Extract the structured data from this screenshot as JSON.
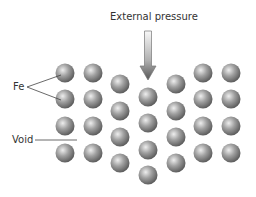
{
  "title": "External pressure",
  "labels": {
    "fe": "Fe",
    "void": "Void"
  },
  "colors": {
    "sphere_light": "#e8e8e8",
    "sphere_mid": "#9a9a9a",
    "sphere_dark": "#5a5a5a",
    "arrow_light": "#f2f2f2",
    "arrow_dark": "#666666",
    "line": "#444444"
  },
  "spheres": [
    {
      "x": 65,
      "y": 73
    },
    {
      "x": 65,
      "y": 99
    },
    {
      "x": 65,
      "y": 126
    },
    {
      "x": 65,
      "y": 153
    },
    {
      "x": 93,
      "y": 73
    },
    {
      "x": 93,
      "y": 99
    },
    {
      "x": 93,
      "y": 126
    },
    {
      "x": 93,
      "y": 153
    },
    {
      "x": 120,
      "y": 84
    },
    {
      "x": 120,
      "y": 111
    },
    {
      "x": 120,
      "y": 137
    },
    {
      "x": 120,
      "y": 163
    },
    {
      "x": 148,
      "y": 97
    },
    {
      "x": 148,
      "y": 123
    },
    {
      "x": 148,
      "y": 150
    },
    {
      "x": 148,
      "y": 175
    },
    {
      "x": 176,
      "y": 84
    },
    {
      "x": 176,
      "y": 111
    },
    {
      "x": 176,
      "y": 137
    },
    {
      "x": 176,
      "y": 163
    },
    {
      "x": 203,
      "y": 73
    },
    {
      "x": 203,
      "y": 99
    },
    {
      "x": 203,
      "y": 126
    },
    {
      "x": 203,
      "y": 153
    },
    {
      "x": 231,
      "y": 73
    },
    {
      "x": 231,
      "y": 99
    },
    {
      "x": 231,
      "y": 126
    },
    {
      "x": 231,
      "y": 153
    }
  ],
  "sphere_radius": 9.5
}
